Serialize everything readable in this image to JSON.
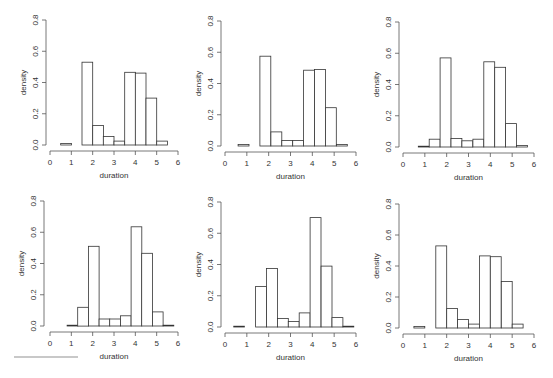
{
  "figure": {
    "layout": {
      "rows": 2,
      "cols": 3
    },
    "axis_color": "#555555",
    "bar_stroke": "#333333",
    "bar_fill": "#ffffff"
  },
  "chart_data": [
    {
      "type": "bar",
      "subtype": "histogram",
      "title": "",
      "xlabel": "duration",
      "ylabel": "density",
      "xlim": [
        0,
        6
      ],
      "ylim": [
        0,
        0.8
      ],
      "xticks": [
        "0",
        "1",
        "2",
        "3",
        "4",
        "5",
        "6"
      ],
      "yticks": [
        "0.0",
        "0.2",
        "0.4",
        "0.6",
        "0.8"
      ],
      "grid": false,
      "bin_start": 0.5,
      "bin_width": 0.5,
      "values": [
        0.01,
        0.0,
        0.53,
        0.125,
        0.055,
        0.025,
        0.465,
        0.46,
        0.3,
        0.025
      ]
    },
    {
      "type": "bar",
      "subtype": "histogram",
      "title": "",
      "xlabel": "duration",
      "ylabel": "density",
      "xlim": [
        0,
        6
      ],
      "ylim": [
        0,
        0.8
      ],
      "xticks": [
        "0",
        "1",
        "2",
        "3",
        "4",
        "5",
        "6"
      ],
      "yticks": [
        "0.0",
        "0.2",
        "0.4",
        "0.6",
        "0.8"
      ],
      "grid": false,
      "bin_start": 0.6,
      "bin_width": 0.5,
      "values": [
        0.01,
        0.0,
        0.575,
        0.09,
        0.035,
        0.035,
        0.485,
        0.49,
        0.245,
        0.01
      ]
    },
    {
      "type": "bar",
      "subtype": "histogram",
      "title": "",
      "xlabel": "duration",
      "ylabel": "density",
      "xlim": [
        0,
        6
      ],
      "ylim": [
        0,
        0.8
      ],
      "xticks": [
        "0",
        "1",
        "2",
        "3",
        "4",
        "5",
        "6"
      ],
      "yticks": [
        "0.0",
        "0.2",
        "0.4",
        "0.6",
        "0.8"
      ],
      "grid": false,
      "bin_start": 0.7,
      "bin_width": 0.5,
      "values": [
        0.005,
        0.05,
        0.57,
        0.055,
        0.04,
        0.05,
        0.545,
        0.51,
        0.15,
        0.01
      ]
    },
    {
      "type": "bar",
      "subtype": "histogram",
      "title": "",
      "xlabel": "duration",
      "ylabel": "density",
      "xlim": [
        0,
        6
      ],
      "ylim": [
        0,
        0.8
      ],
      "xticks": [
        "0",
        "1",
        "2",
        "3",
        "4",
        "5",
        "6"
      ],
      "yticks": [
        "0.0",
        "0.2",
        "0.4",
        "0.6",
        "0.8"
      ],
      "grid": false,
      "bin_start": 0.8,
      "bin_width": 0.5,
      "values": [
        0.005,
        0.12,
        0.51,
        0.045,
        0.045,
        0.065,
        0.635,
        0.465,
        0.09,
        0.005
      ]
    },
    {
      "type": "bar",
      "subtype": "histogram",
      "title": "",
      "xlabel": "duration",
      "ylabel": "density",
      "xlim": [
        0,
        6
      ],
      "ylim": [
        0,
        0.8
      ],
      "xticks": [
        "0",
        "1",
        "2",
        "3",
        "4",
        "5",
        "6"
      ],
      "yticks": [
        "0.0",
        "0.2",
        "0.4",
        "0.6",
        "0.8"
      ],
      "grid": false,
      "bin_start": 0.4,
      "bin_width": 0.5,
      "values": [
        0.005,
        0.0,
        0.26,
        0.375,
        0.055,
        0.035,
        0.09,
        0.7,
        0.39,
        0.06,
        0.005
      ]
    },
    {
      "type": "bar",
      "subtype": "histogram",
      "title": "",
      "xlabel": "duration",
      "ylabel": "density",
      "xlim": [
        0,
        6
      ],
      "ylim": [
        0,
        0.8
      ],
      "xticks": [
        "0",
        "1",
        "2",
        "3",
        "4",
        "5",
        "6"
      ],
      "yticks": [
        "0.0",
        "0.2",
        "0.4",
        "0.6",
        "0.8"
      ],
      "grid": false,
      "bin_start": 0.5,
      "bin_width": 0.5,
      "values": [
        0.01,
        0.0,
        0.53,
        0.125,
        0.055,
        0.025,
        0.465,
        0.46,
        0.3,
        0.025
      ]
    }
  ],
  "panels_geometry": [
    {
      "x0": 50,
      "x6": 178,
      "y0": 145,
      "y08": 20,
      "axis_x": 46,
      "axis_y": 151
    },
    {
      "x0": 225,
      "x6": 356,
      "y0": 146,
      "y08": 21,
      "axis_x": 221,
      "axis_y": 152
    },
    {
      "x0": 403,
      "x6": 534,
      "y0": 147,
      "y08": 22,
      "axis_x": 399,
      "axis_y": 153
    },
    {
      "x0": 50,
      "x6": 178,
      "y0": 326,
      "y08": 201,
      "axis_x": 44,
      "axis_y": 332
    },
    {
      "x0": 225,
      "x6": 356,
      "y0": 327,
      "y08": 202,
      "axis_x": 221,
      "axis_y": 333
    },
    {
      "x0": 403,
      "x6": 534,
      "y0": 328,
      "y08": 204,
      "axis_x": 399,
      "axis_y": 334
    }
  ]
}
